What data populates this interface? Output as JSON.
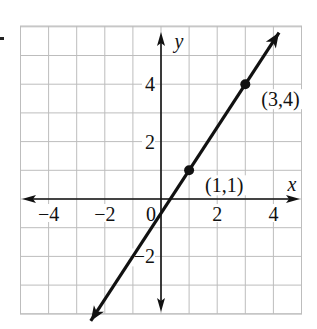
{
  "chart_data": {
    "type": "line",
    "title": "",
    "xlabel": "x",
    "ylabel": "y",
    "xlim": [
      -5,
      5
    ],
    "ylim": [
      -4.2,
      6
    ],
    "grid": true,
    "x_ticks": [
      -4,
      -2,
      0,
      2,
      4
    ],
    "x_tick_labels": [
      "−4",
      "−2",
      "0",
      "2",
      "4"
    ],
    "y_ticks": [
      4,
      2,
      -2
    ],
    "y_tick_labels": [
      "4",
      "2",
      "−2"
    ],
    "series": [
      {
        "name": "y = (3/2)x − 1/2",
        "x": [
          -2.5,
          4.2
        ],
        "y": [
          -4.25,
          5.8
        ],
        "color": "#111111"
      }
    ],
    "points": [
      {
        "x": 1,
        "y": 1,
        "label": "(1,1)"
      },
      {
        "x": 3,
        "y": 4,
        "label": "(3,4)"
      }
    ],
    "legend": null
  }
}
